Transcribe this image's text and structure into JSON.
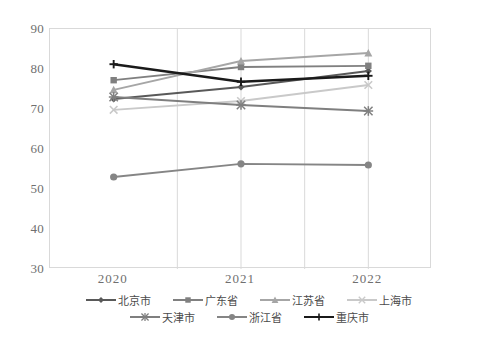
{
  "chart_data": {
    "type": "line",
    "title": "",
    "subtitle": "",
    "xlabel": "",
    "ylabel": "",
    "categories": [
      "2020",
      "2021",
      "2022"
    ],
    "ylim": [
      30,
      90
    ],
    "yticks": [
      30,
      40,
      50,
      60,
      70,
      80,
      90
    ],
    "grid": "vertical-only",
    "legend_position": "bottom",
    "series": [
      {
        "name": "北京市",
        "marker": "diamond",
        "color": "#595959",
        "values": [
          72.5,
          75.5,
          79.5
        ]
      },
      {
        "name": "广东省",
        "marker": "square",
        "color": "#808080",
        "values": [
          77.2,
          80.5,
          80.8
        ]
      },
      {
        "name": "江苏省",
        "marker": "triangle",
        "color": "#a6a6a6",
        "values": [
          74.8,
          82.0,
          84.0
        ]
      },
      {
        "name": "上海市",
        "marker": "x-cross",
        "color": "#c9c9c9",
        "values": [
          69.8,
          72.0,
          76.0
        ]
      },
      {
        "name": "天津市",
        "marker": "asterisk",
        "color": "#7f7f7f",
        "values": [
          73.0,
          71.0,
          69.5
        ]
      },
      {
        "name": "浙江省",
        "marker": "circle",
        "color": "#858585",
        "values": [
          53.0,
          56.3,
          56.0
        ]
      },
      {
        "name": "重庆市",
        "marker": "plus",
        "color": "#1a1a1a",
        "values": [
          81.2,
          76.8,
          78.3
        ]
      }
    ]
  },
  "axis": {
    "y_tick_labels": [
      "90",
      "80",
      "70",
      "60",
      "50",
      "40",
      "30"
    ],
    "x_tick_labels": [
      "2020",
      "2021",
      "2022"
    ]
  },
  "colors": {
    "plot_border": "#d9d9d9",
    "gridline": "#d9d9d9",
    "tick_text": "#6f6f6f",
    "legend_text": "#4a4a4a",
    "background": "#ffffff"
  }
}
